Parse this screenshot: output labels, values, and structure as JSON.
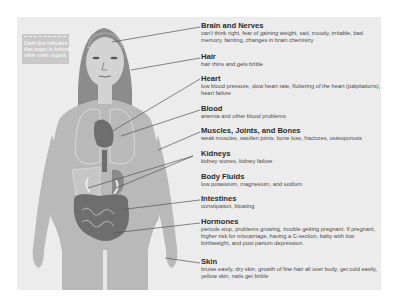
{
  "legend": {
    "text": "Dash line indicates that organ is behind other main organs."
  },
  "colors": {
    "panel_bg": "#ececec",
    "body_fill": "#b9b9b9",
    "hair_fill": "#8c8c8c",
    "organ_fill": "#6e6e6e",
    "leader_line": "#555555",
    "title_text": "#2b2b2b",
    "desc_text": "#4a4a4a"
  },
  "items": [
    {
      "title": "Brain and Nerves",
      "desc": "can't think right, fear of gaining weight, sad, moody, irritable, bad memory, fainting, changes in brain chemistry"
    },
    {
      "title": "Hair",
      "desc": "hair thins and gets brittle"
    },
    {
      "title": "Heart",
      "desc": "low blood pressure, slow heart rate, fluttering of the heart (palpitations), heart failure"
    },
    {
      "title": "Blood",
      "desc": "anemia and other blood problems"
    },
    {
      "title": "Muscles, Joints, and Bones",
      "desc": "weak muscles, swollen joints, bone loss, fractures, osteoporosis"
    },
    {
      "title": "Kidneys",
      "desc": "kidney stones, kidney failure"
    },
    {
      "title": "Body Fluids",
      "desc": "low potassium, magnesium, and sodium"
    },
    {
      "title": "Intestines",
      "desc": "constipation, bloating"
    },
    {
      "title": "Hormones",
      "desc": "periods stop, problems growing, trouble getting pregnant. If pregnant, higher risk for miscarriage, having a C-section, baby with low birthweight, and post partum depression."
    },
    {
      "title": "Skin",
      "desc": "bruise easily, dry skin, growth of fine hair all over body, get cold easily, yellow skin, nails get brittle"
    }
  ]
}
